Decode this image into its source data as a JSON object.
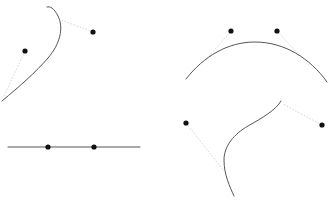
{
  "figure": {
    "width": 334,
    "height": 205,
    "background_color": "#ffffff",
    "layout": "2x2 panel grid of curve-and-point diagrams",
    "curve_color": "#555555",
    "curve_width": 1,
    "leader_color": "#d8d8d8",
    "leader_width": 1,
    "leader_dash": "1.6 1.6",
    "dot_color": "#111111",
    "dot_radius": 2.6
  },
  "panels": [
    {
      "id": "panel-top-left",
      "name": "S-curve with two offset points",
      "curve_type": "cubic-bezier-s-curve",
      "curve_path": "M 2 101 C 20 86 36 72 48 58 C 60 44 64 28 58 16 C 54 8 50 6 47 7",
      "points": [
        {
          "id": "tl-point-a",
          "x": 25,
          "y": 51,
          "label": ""
        },
        {
          "id": "tl-point-b",
          "x": 93,
          "y": 32,
          "label": ""
        }
      ],
      "leaders": [
        {
          "id": "tl-leader-a",
          "from_x": 25,
          "from_y": 51,
          "to_x": 4,
          "to_y": 96
        },
        {
          "id": "tl-leader-b",
          "from_x": 93,
          "from_y": 32,
          "to_x": 61,
          "to_y": 20
        }
      ]
    },
    {
      "id": "panel-top-right",
      "name": "Convex arc with two points above",
      "curve_type": "arc-convex-up",
      "curve_path": "M 186 79 C 204 56 228 42 255 42 C 284 42 310 58 327 82",
      "points": [
        {
          "id": "tr-point-a",
          "x": 231,
          "y": 31,
          "label": ""
        },
        {
          "id": "tr-point-b",
          "x": 277,
          "y": 31,
          "label": ""
        }
      ],
      "leaders": [
        {
          "id": "tr-leader-a",
          "from_x": 231,
          "from_y": 31,
          "to_x": 204,
          "to_y": 62
        },
        {
          "id": "tr-leader-b",
          "from_x": 277,
          "from_y": 31,
          "to_x": 309,
          "to_y": 65
        }
      ]
    },
    {
      "id": "panel-bottom-left",
      "name": "Straight horizontal line with two points on it",
      "curve_type": "straight-line",
      "curve_path": "M 8 147 L 140 147",
      "points": [
        {
          "id": "bl-point-a",
          "x": 48,
          "y": 147,
          "label": ""
        },
        {
          "id": "bl-point-b",
          "x": 94,
          "y": 147,
          "label": ""
        }
      ],
      "leaders": []
    },
    {
      "id": "panel-bottom-right",
      "name": "S-curve with two points at the sides",
      "curve_type": "cubic-bezier-s-curve",
      "curve_path": "M 281 101 C 276 110 262 118 248 126 C 234 134 224 146 224 160 C 224 175 230 187 234 196",
      "points": [
        {
          "id": "br-point-a",
          "x": 186,
          "y": 123,
          "label": ""
        },
        {
          "id": "br-point-b",
          "x": 322,
          "y": 125,
          "label": ""
        }
      ],
      "leaders": [
        {
          "id": "br-leader-a",
          "from_x": 186,
          "from_y": 123,
          "to_x": 224,
          "to_y": 171
        },
        {
          "id": "br-leader-b",
          "from_x": 322,
          "from_y": 125,
          "to_x": 283,
          "to_y": 104
        }
      ]
    }
  ],
  "chart_data": {
    "type": "line",
    "title": "",
    "xlabel": "",
    "ylabel": "",
    "grid": false,
    "legend": "none",
    "series": [
      {
        "name": "top-left S-curve",
        "points": [
          [
            2,
            101
          ],
          [
            14,
            91
          ],
          [
            26,
            81
          ],
          [
            37,
            70
          ],
          [
            46,
            59
          ],
          [
            54,
            47
          ],
          [
            58,
            35
          ],
          [
            58,
            24
          ],
          [
            54,
            14
          ],
          [
            49,
            7
          ]
        ]
      },
      {
        "name": "top-right convex arc",
        "points": [
          [
            186,
            79
          ],
          [
            197,
            67
          ],
          [
            210,
            57
          ],
          [
            225,
            49
          ],
          [
            241,
            44
          ],
          [
            256,
            42
          ],
          [
            272,
            44
          ],
          [
            288,
            50
          ],
          [
            304,
            60
          ],
          [
            318,
            71
          ],
          [
            327,
            82
          ]
        ]
      },
      {
        "name": "bottom-left straight line",
        "points": [
          [
            8,
            147
          ],
          [
            140,
            147
          ]
        ]
      },
      {
        "name": "bottom-right S-curve",
        "points": [
          [
            281,
            101
          ],
          [
            274,
            110
          ],
          [
            264,
            117
          ],
          [
            253,
            124
          ],
          [
            242,
            131
          ],
          [
            233,
            140
          ],
          [
            227,
            150
          ],
          [
            224,
            161
          ],
          [
            225,
            173
          ],
          [
            229,
            185
          ],
          [
            234,
            196
          ]
        ]
      }
    ],
    "marked_points": [
      {
        "panel": "top-left",
        "x": 25,
        "y": 51
      },
      {
        "panel": "top-left",
        "x": 93,
        "y": 32
      },
      {
        "panel": "top-right",
        "x": 231,
        "y": 31
      },
      {
        "panel": "top-right",
        "x": 277,
        "y": 31
      },
      {
        "panel": "bottom-left",
        "x": 48,
        "y": 147
      },
      {
        "panel": "bottom-left",
        "x": 94,
        "y": 147
      },
      {
        "panel": "bottom-right",
        "x": 186,
        "y": 123
      },
      {
        "panel": "bottom-right",
        "x": 322,
        "y": 125
      }
    ]
  }
}
